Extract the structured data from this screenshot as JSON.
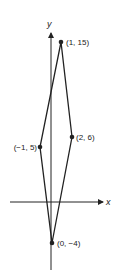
{
  "diagram": {
    "type": "coordinate-plane-quadrilateral",
    "axes": {
      "x_label": "x",
      "y_label": "y"
    },
    "points": [
      {
        "label": "(1, 15)",
        "x": 1,
        "y": 15
      },
      {
        "label": "(2, 6)",
        "x": 2,
        "y": 6
      },
      {
        "label": "(0, −4)",
        "x": 0,
        "y": -4
      },
      {
        "label": "(−1, 5)",
        "x": -1,
        "y": 5
      }
    ],
    "colors": {
      "line": "#222222",
      "background": "#ffffff"
    }
  }
}
